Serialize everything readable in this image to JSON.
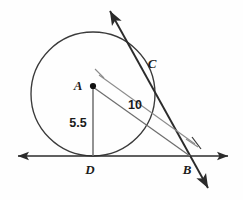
{
  "figure": {
    "background_color": "#fefefe",
    "stroke_color": "#2b2b2b",
    "light_stroke_color": "#8c8c8c",
    "label_color": "#1b1b1b"
  },
  "points": {
    "A": {
      "label": "A",
      "x": 93,
      "y": 86,
      "label_x": 78,
      "label_y": 90,
      "role": "circle-center"
    },
    "B": {
      "label": "B",
      "x": 190,
      "y": 156,
      "label_x": 185,
      "label_y": 172,
      "role": "external-point"
    },
    "C": {
      "label": "C",
      "x": 145,
      "y": 70,
      "label_x": 151,
      "label_y": 66,
      "role": "tangency-point-upper"
    },
    "D": {
      "label": "D",
      "x": 93,
      "y": 156,
      "label_x": 87,
      "label_y": 172,
      "role": "tangency-point-lower"
    }
  },
  "circle": {
    "center_x": 93,
    "center_y": 94,
    "radius": 62
  },
  "measurements": [
    {
      "name": "radius-to-D",
      "value": "5.5",
      "x": 78,
      "y": 126,
      "from": "A",
      "to": "D"
    },
    {
      "name": "distance-A-to-B",
      "value": "10",
      "x": 131,
      "y": 109,
      "from": "A",
      "to": "B"
    }
  ],
  "lines": {
    "horizontal_tangent": {
      "name": "horizontal-tangent-line",
      "x1": 18,
      "y1": 156,
      "x2": 228,
      "y2": 156,
      "arrows": "both"
    },
    "secant_through_C_B": {
      "name": "secant-line-through-C-and-B",
      "x1": 110,
      "y1": 11,
      "x2": 208,
      "y2": 188,
      "arrows": "both"
    },
    "segment_A_D": {
      "name": "segment-A-to-D",
      "x1": 93,
      "y1": 86,
      "x2": 93,
      "y2": 156
    },
    "segment_A_B": {
      "name": "segment-A-to-B",
      "x1": 93,
      "y1": 86,
      "x2": 190,
      "y2": 156
    },
    "dimension_line": {
      "name": "dimension-line-A-to-B",
      "x1": 99,
      "y1": 76,
      "x2": 196,
      "y2": 146
    }
  },
  "ticks": [
    {
      "name": "dimension-tick-near-A",
      "x1": 94,
      "y1": 69,
      "x2": 104,
      "y2": 79
    },
    {
      "name": "dimension-tick-near-B",
      "x1": 186,
      "y1": 138,
      "x2": 199,
      "y2": 147
    },
    {
      "name": "angle-tick-at-B",
      "x1": 190,
      "y1": 138,
      "x2": 202,
      "y2": 150
    }
  ]
}
